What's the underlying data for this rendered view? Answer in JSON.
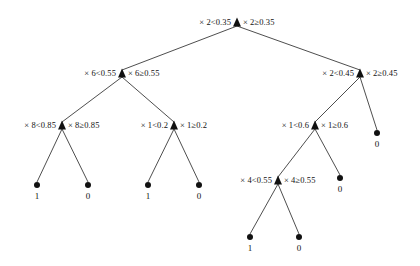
{
  "figure": {
    "type": "decision-tree-diagram",
    "width": 420,
    "height": 266,
    "background_color": "#ffffff",
    "line_color": "#3a3a3a",
    "text_color": "#121212",
    "internal_node_glyph": "filled-up-triangle",
    "leaf_node_glyph": "filled-circle"
  },
  "nodes": [
    {
      "id": "n0",
      "kind": "internal",
      "x": 237,
      "y": 22,
      "feature": "2",
      "threshold": "0.35",
      "left_label": "× 2<0.35",
      "right_label": "× 2≥0.35"
    },
    {
      "id": "n1",
      "kind": "internal",
      "x": 122,
      "y": 73,
      "feature": "6",
      "threshold": "0.55",
      "left_label": "× 6<0.55",
      "right_label": "× 6≥0.55"
    },
    {
      "id": "n2",
      "kind": "internal",
      "x": 360,
      "y": 73,
      "feature": "2",
      "threshold": "0.45",
      "left_label": "× 2<0.45",
      "right_label": "× 2≥0.45"
    },
    {
      "id": "n3",
      "kind": "internal",
      "x": 62,
      "y": 125,
      "feature": "8",
      "threshold": "0.85",
      "left_label": "× 8<0.85",
      "right_label": "× 8≥0.85"
    },
    {
      "id": "n4",
      "kind": "internal",
      "x": 174,
      "y": 125,
      "feature": "1",
      "threshold": "0.2",
      "left_label": "× 1<0.2",
      "right_label": "× 1≥0.2"
    },
    {
      "id": "n5",
      "kind": "internal",
      "x": 315,
      "y": 125,
      "feature": "1",
      "threshold": "0.6",
      "left_label": "× 1<0.6",
      "right_label": "× 1≥0.6"
    },
    {
      "id": "n6",
      "kind": "internal",
      "x": 278,
      "y": 180,
      "feature": "4",
      "threshold": "0.55",
      "left_label": "× 4<0.55",
      "right_label": "× 4≥0.55"
    },
    {
      "id": "l1",
      "kind": "leaf",
      "x": 37,
      "y": 185,
      "label": "1"
    },
    {
      "id": "l2",
      "kind": "leaf",
      "x": 88,
      "y": 185,
      "label": "0"
    },
    {
      "id": "l3",
      "kind": "leaf",
      "x": 148,
      "y": 185,
      "label": "1"
    },
    {
      "id": "l4",
      "kind": "leaf",
      "x": 199,
      "y": 185,
      "label": "0"
    },
    {
      "id": "l5",
      "kind": "leaf",
      "x": 340,
      "y": 178,
      "label": "0"
    },
    {
      "id": "l6",
      "kind": "leaf",
      "x": 377,
      "y": 133,
      "label": "0"
    },
    {
      "id": "l7",
      "kind": "leaf",
      "x": 250,
      "y": 237,
      "label": "1"
    },
    {
      "id": "l8",
      "kind": "leaf",
      "x": 299,
      "y": 237,
      "label": "0"
    }
  ],
  "edges": [
    {
      "from": "n0",
      "to": "n1",
      "branch": "left"
    },
    {
      "from": "n0",
      "to": "n2",
      "branch": "right"
    },
    {
      "from": "n1",
      "to": "n3",
      "branch": "left"
    },
    {
      "from": "n1",
      "to": "n4",
      "branch": "right"
    },
    {
      "from": "n2",
      "to": "n5",
      "branch": "left"
    },
    {
      "from": "n2",
      "to": "l6",
      "branch": "right"
    },
    {
      "from": "n3",
      "to": "l1",
      "branch": "left"
    },
    {
      "from": "n3",
      "to": "l2",
      "branch": "right"
    },
    {
      "from": "n4",
      "to": "l3",
      "branch": "left"
    },
    {
      "from": "n4",
      "to": "l4",
      "branch": "right"
    },
    {
      "from": "n5",
      "to": "n6",
      "branch": "left"
    },
    {
      "from": "n5",
      "to": "l5",
      "branch": "right"
    },
    {
      "from": "n6",
      "to": "l7",
      "branch": "left"
    },
    {
      "from": "n6",
      "to": "l8",
      "branch": "right"
    }
  ]
}
